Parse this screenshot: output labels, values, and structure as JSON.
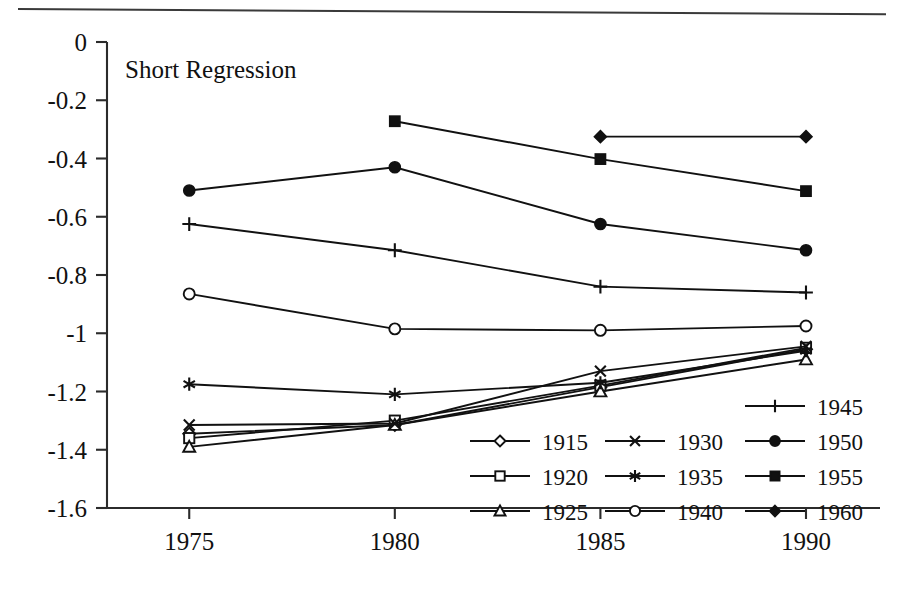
{
  "figure": {
    "background_color": "#ffffff",
    "ink_color": "#111111",
    "top_rule": true
  },
  "chart_data": {
    "type": "line",
    "title": "Short Regression",
    "xlabel": "",
    "ylabel": "",
    "categories": [
      "1975",
      "1980",
      "1985",
      "1990"
    ],
    "x": [
      1975,
      1980,
      1985,
      1990
    ],
    "xlim": [
      1973.0,
      1991.8
    ],
    "ylim": [
      -1.6,
      0
    ],
    "y_ticks": [
      "0",
      "-0.2",
      "-0.4",
      "-0.6",
      "-0.8",
      "-1",
      "-1.2",
      "-1.4",
      "-1.6"
    ],
    "y_tick_values": [
      0,
      -0.2,
      -0.4,
      -0.6,
      -0.8,
      -1.0,
      -1.2,
      -1.4,
      -1.6
    ],
    "x_ticks": [
      "1975",
      "1980",
      "1985",
      "1990"
    ],
    "grid": false,
    "legend_position": "inside-lower-right",
    "series": [
      {
        "name": "1915",
        "marker": "diamond-open",
        "values": [
          -1.345,
          -1.315,
          -1.185,
          -1.055
        ]
      },
      {
        "name": "1920",
        "marker": "square-open",
        "values": [
          -1.36,
          -1.3,
          -1.18,
          -1.05
        ]
      },
      {
        "name": "1925",
        "marker": "triangle-open",
        "values": [
          -1.39,
          -1.315,
          -1.2,
          -1.09
        ]
      },
      {
        "name": "1930",
        "marker": "x-cross",
        "values": [
          -1.315,
          -1.31,
          -1.13,
          -1.045
        ]
      },
      {
        "name": "1935",
        "marker": "asterisk",
        "values": [
          -1.175,
          -1.21,
          -1.17,
          -1.06
        ]
      },
      {
        "name": "1940",
        "marker": "circle-open",
        "values": [
          -0.865,
          -0.985,
          -0.99,
          -0.975
        ]
      },
      {
        "name": "1945",
        "marker": "plus",
        "values": [
          -0.625,
          -0.715,
          -0.84,
          -0.86
        ]
      },
      {
        "name": "1950",
        "marker": "circle-filled",
        "values": [
          -0.51,
          -0.43,
          -0.625,
          -0.715
        ]
      },
      {
        "name": "1955",
        "marker": "square-filled",
        "values": [
          null,
          -0.272,
          -0.402,
          -0.512
        ]
      },
      {
        "name": "1960",
        "marker": "diamond-filled",
        "values": [
          null,
          null,
          -0.325,
          -0.325
        ]
      }
    ],
    "legend_columns": [
      [
        "1915",
        "1920",
        "1925"
      ],
      [
        "1930",
        "1935",
        "1940"
      ],
      [
        "1945",
        "1950",
        "1955",
        "1960"
      ]
    ]
  }
}
